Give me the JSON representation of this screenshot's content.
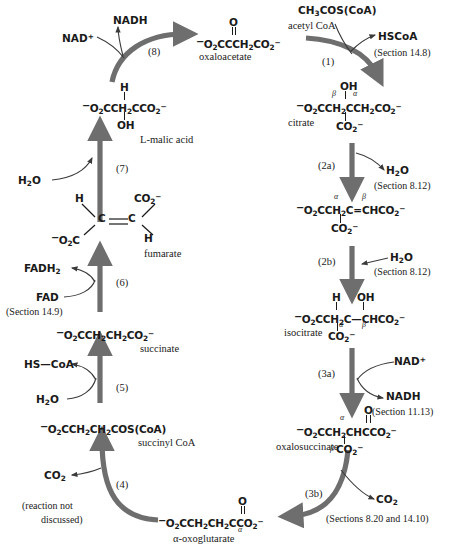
{
  "diagram": {
    "arrow_color": "#6e6e6e",
    "thin_arrow_color": "#3a3a3a",
    "text_color": "#1a1a1a",
    "background": "#ffffff"
  },
  "metabolites": {
    "oxaloacetate": {
      "name": "oxaloacetate",
      "carbonyl_o": "O",
      "formula_a": "O",
      "formula_b": "2",
      "formula_main": "CCCH",
      "formula_line": "O2CCCH2CO2"
    },
    "citrate": {
      "name": "citrate",
      "oh": "OH",
      "co2": "CO2",
      "beta": "β",
      "alpha": "α"
    },
    "aconitate": {
      "name": "",
      "co2": "CO2",
      "alpha": "α",
      "beta": "β"
    },
    "isocitrate": {
      "name": "isocitrate",
      "h": "H",
      "oh": "OH",
      "co2": "CO2",
      "alpha": "α",
      "beta": "β"
    },
    "oxalosuccinate": {
      "name": "oxalosuccinate",
      "carbonyl_o": "O",
      "co2": "CO2",
      "alpha": "α",
      "beta": "β"
    },
    "oxoglutarate": {
      "name": "α-oxoglutarate",
      "carbonyl_o": "O",
      "alpha": "α"
    },
    "succinyl_coa": {
      "name": "succinyl CoA"
    },
    "succinate": {
      "name": "succinate"
    },
    "fumarate": {
      "name": "fumarate",
      "h_top": "H",
      "h_bottom": "H",
      "c_left": "C",
      "c_right": "C",
      "co2_top": "CO2",
      "o2c_left": "O2C"
    },
    "malic_acid": {
      "name": "L-malic acid",
      "h": "H",
      "oh": "OH"
    }
  },
  "steps": [
    {
      "id": "1",
      "label": "(1)"
    },
    {
      "id": "2a",
      "label": "(2a)"
    },
    {
      "id": "2b",
      "label": "(2b)"
    },
    {
      "id": "3a",
      "label": "(3a)"
    },
    {
      "id": "3b",
      "label": "(3b)"
    },
    {
      "id": "4",
      "label": "(4)"
    },
    {
      "id": "5",
      "label": "(5)"
    },
    {
      "id": "6",
      "label": "(6)"
    },
    {
      "id": "7",
      "label": "(7)"
    },
    {
      "id": "8",
      "label": "(8)"
    }
  ],
  "cofactors": {
    "acetyl_coa_formula": "CH3COS(CoA)",
    "acetyl_coa_name": "acetyl CoA",
    "hscoa": "HSCoA",
    "hs_coa": "HS—CoA",
    "nad_plus_1": "NAD+",
    "nadh_1": "NADH",
    "nad_plus_2": "NAD+",
    "nadh_2": "NADH",
    "fad": "FAD",
    "fadh2": "FADH2",
    "water_2a": "H2O",
    "water_2b": "H2O",
    "water_5": "H2O",
    "water_7": "H2O",
    "co2_3b": "CO2",
    "co2_4": "CO2"
  },
  "annotations": {
    "section_14_8": "(Section 14.8)",
    "section_8_12_a": "(Section 8.12)",
    "section_8_12_b": "(Section 8.12)",
    "section_11_13": "(Section 11.13)",
    "sections_8_20_14_10": "(Sections 8.20 and 14.10)",
    "section_14_9": "(Section 14.9)",
    "reaction_not_discussed_line1": "(reaction not",
    "reaction_not_discussed_line2": "discussed)"
  }
}
